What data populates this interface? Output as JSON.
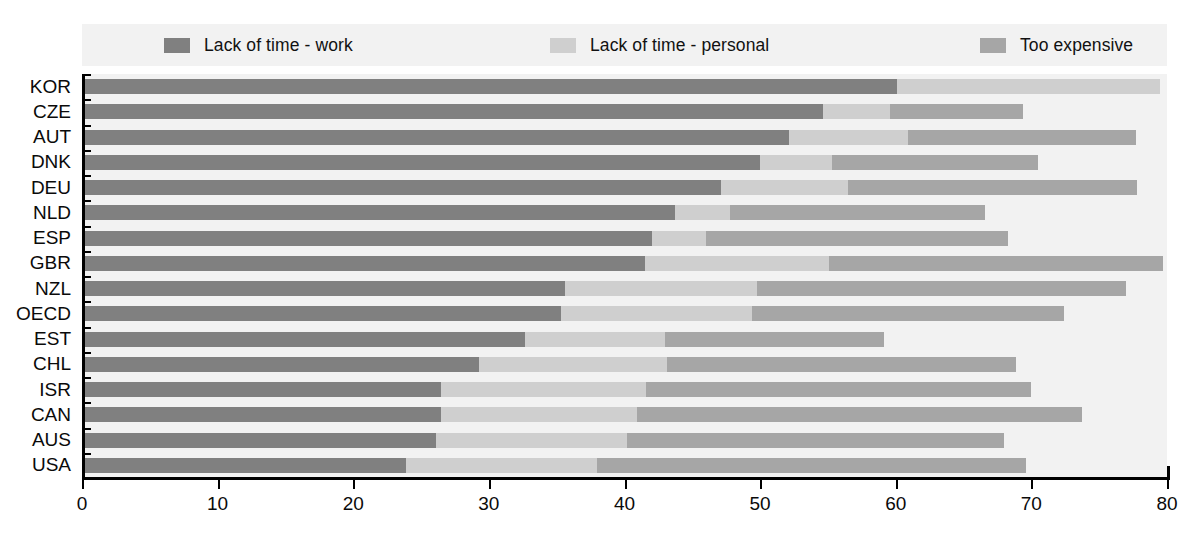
{
  "chart_data": {
    "type": "bar",
    "orientation": "horizontal",
    "stacked": true,
    "title": "",
    "subtitle": "",
    "xlabel": "",
    "ylabel": "",
    "xlim": [
      0,
      80
    ],
    "xticks": [
      0,
      10,
      20,
      30,
      40,
      50,
      60,
      70,
      80
    ],
    "xtick_labels": [
      "0",
      "10",
      "20",
      "30",
      "40",
      "50",
      "60",
      "70",
      "80"
    ],
    "grid": false,
    "legend_position": "top",
    "categories": [
      "KOR",
      "CZE",
      "AUT",
      "DNK",
      "DEU",
      "NLD",
      "ESP",
      "GBR",
      "NZL",
      "OECD",
      "EST",
      "CHL",
      "ISR",
      "CAN",
      "AUS",
      "USA"
    ],
    "series": [
      {
        "name": "Lack of time - work",
        "color": "#808080",
        "values": [
          60.1,
          54.6,
          52.1,
          50.0,
          47.1,
          43.7,
          42.0,
          41.5,
          35.6,
          35.3,
          32.7,
          29.3,
          26.5,
          26.5,
          26.1,
          23.9
        ]
      },
      {
        "name": "Lack of time - personal",
        "color": "#cfcfcf",
        "values": [
          19.4,
          5.0,
          8.8,
          5.3,
          9.4,
          4.1,
          4.0,
          13.6,
          14.2,
          14.1,
          10.3,
          13.8,
          15.1,
          14.4,
          14.1,
          14.1
        ]
      },
      {
        "name": "Too expensive",
        "color": "#a6a6a6",
        "values": [
          0.0,
          9.8,
          16.8,
          15.2,
          21.3,
          18.8,
          22.3,
          24.6,
          27.2,
          23.0,
          16.1,
          25.8,
          28.4,
          32.8,
          27.8,
          31.6
        ]
      }
    ],
    "totals": [
      79.5,
      69.4,
      77.7,
      70.5,
      77.8,
      66.6,
      68.3,
      79.7,
      77.0,
      72.4,
      59.1,
      68.9,
      70.0,
      73.7,
      68.0,
      69.6
    ]
  },
  "legend": {
    "items": [
      {
        "label": "Lack of time - work",
        "color": "#808080",
        "swatch_name": "legend-swatch-work"
      },
      {
        "label": "Lack of time - personal",
        "color": "#cfcfcf",
        "swatch_name": "legend-swatch-personal"
      },
      {
        "label": "Too expensive",
        "color": "#a6a6a6",
        "swatch_name": "legend-swatch-expensive"
      }
    ]
  },
  "colors": {
    "plot_background": "#f2f2f2",
    "legend_background": "#f2f2f2",
    "axis": "#000000",
    "text": "#0a0a0a",
    "series_work": "#808080",
    "series_personal": "#cfcfcf",
    "series_expensive": "#a6a6a6"
  }
}
